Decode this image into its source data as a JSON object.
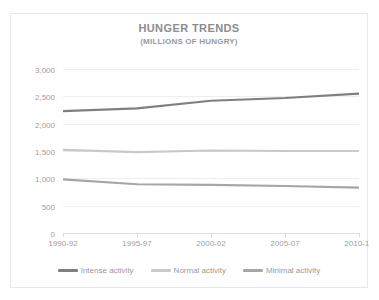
{
  "chart_data": {
    "type": "line",
    "title": "HUNGER TRENDS",
    "subtitle": "(MILLIONS OF HUNGRY)",
    "xlabel": "",
    "ylabel": "",
    "categories": [
      "1990-92",
      "1995-97",
      "2000-02",
      "2005-07",
      "2010-12"
    ],
    "ylim": [
      0,
      3000
    ],
    "ytick_labels": [
      "3,000",
      "2,500",
      "2,000",
      "1,500",
      "1,000",
      "500",
      "0"
    ],
    "ytick_values": [
      3000,
      2500,
      2000,
      1500,
      1000,
      500,
      0
    ],
    "grid": true,
    "legend_position": "bottom",
    "series": [
      {
        "name": "Intense activity",
        "color": "#7f7f7f",
        "values": [
          2230,
          2280,
          2420,
          2470,
          2550
        ]
      },
      {
        "name": "Normal activity",
        "color": "#c9c9c9",
        "values": [
          1520,
          1480,
          1510,
          1500,
          1500
        ]
      },
      {
        "name": "Minimal activity",
        "color": "#a6a6a6",
        "values": [
          980,
          890,
          880,
          860,
          830
        ]
      }
    ]
  }
}
